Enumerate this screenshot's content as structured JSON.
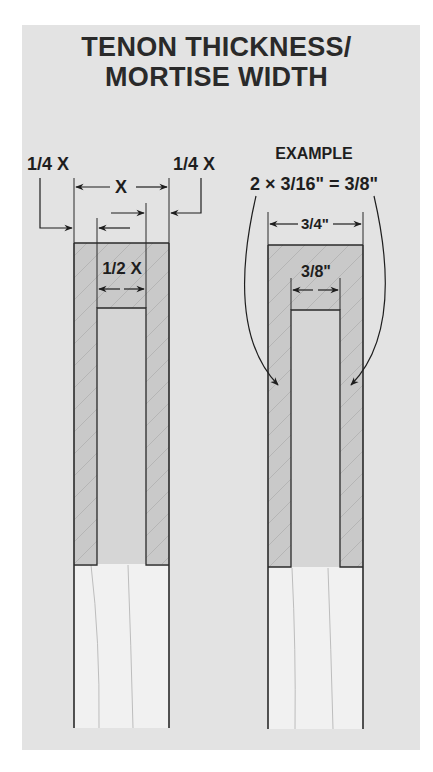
{
  "title": {
    "line1": "TENON THICKNESS/",
    "line2": "MORTISE WIDTH"
  },
  "left_diagram": {
    "label_left_quarter": "1/4 X",
    "label_right_quarter": "1/4 X",
    "label_total": "X",
    "label_half": "1/2 X"
  },
  "right_diagram": {
    "heading": "EXAMPLE",
    "equation": "2 × 3/16\" = 3/8\"",
    "label_total": "3/4\"",
    "label_mortise": "3/8\""
  },
  "colors": {
    "background": "#e3e3e3",
    "tenon_gray": "#c6c6c6",
    "mortise_gray": "#d4d4d4",
    "wood": "#f1f1f1",
    "line": "#2a2a2a"
  }
}
